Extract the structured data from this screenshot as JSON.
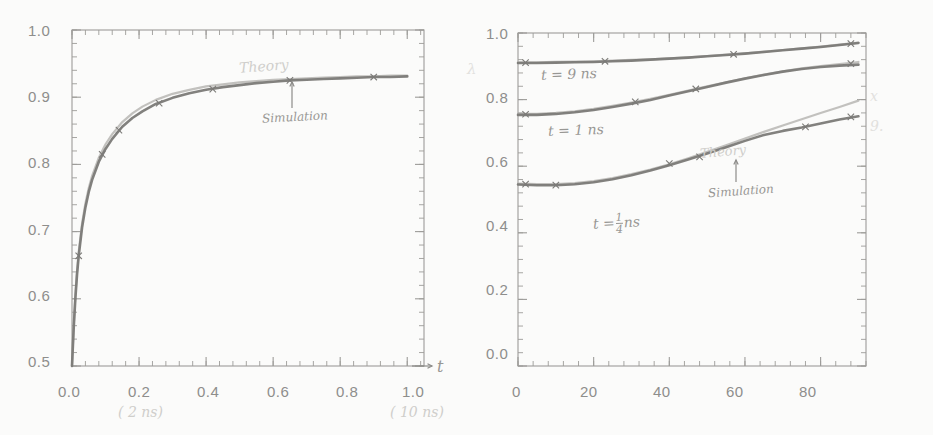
{
  "figure": {
    "background_color": "#fbfbfa",
    "ink_color": "#6f6e6c",
    "pencil_color": "#a8a7a4",
    "panel_count": 2
  },
  "chart_data": [
    {
      "type": "line",
      "panel": "left",
      "title": "",
      "xlabel": "t",
      "ylabel": "",
      "xlim": [
        0.0,
        1.05
      ],
      "ylim": [
        0.5,
        1.0
      ],
      "grid": false,
      "legend_position": "inline-annotations",
      "xticks": [
        0.0,
        0.2,
        0.4,
        0.6,
        0.8,
        1.0
      ],
      "xticklabels": [
        "0.0",
        "0.2",
        "0.4",
        "0.6",
        "0.8",
        "1.0"
      ],
      "yticks": [
        0.5,
        0.6,
        0.7,
        0.8,
        0.9,
        1.0
      ],
      "yticklabels": [
        "0.5",
        "0.6",
        "0.7",
        "0.8",
        "0.9",
        "1.0"
      ],
      "x_unit_notes": [
        {
          "at": 0.2,
          "text": "( 2 ns)"
        },
        {
          "at": 1.0,
          "text": "( 10 ns)"
        }
      ],
      "annotations": [
        {
          "name": "theory-label",
          "text": "Theory",
          "x": 0.63,
          "y": 0.945
        },
        {
          "name": "simulation-label",
          "text": "Simulation",
          "x": 0.7,
          "y": 0.875
        }
      ],
      "series": [
        {
          "name": "Theory",
          "style": "solid-light",
          "x": [
            0.0,
            0.005,
            0.01,
            0.015,
            0.02,
            0.03,
            0.04,
            0.05,
            0.06,
            0.08,
            0.1,
            0.12,
            0.15,
            0.18,
            0.21,
            0.25,
            0.3,
            0.35,
            0.4,
            0.45,
            0.5,
            0.55,
            0.6,
            0.65,
            0.7,
            0.75,
            0.8,
            0.85,
            0.9,
            0.95,
            1.0
          ],
          "y": [
            0.5,
            0.56,
            0.605,
            0.641,
            0.67,
            0.712,
            0.742,
            0.765,
            0.783,
            0.81,
            0.83,
            0.845,
            0.863,
            0.876,
            0.886,
            0.896,
            0.905,
            0.911,
            0.916,
            0.919,
            0.922,
            0.924,
            0.926,
            0.927,
            0.928,
            0.929,
            0.93,
            0.931,
            0.931,
            0.932,
            0.932
          ]
        },
        {
          "name": "Simulation",
          "style": "solid-dark",
          "x": [
            0.0,
            0.005,
            0.01,
            0.015,
            0.02,
            0.03,
            0.04,
            0.05,
            0.06,
            0.08,
            0.1,
            0.12,
            0.15,
            0.18,
            0.21,
            0.25,
            0.3,
            0.35,
            0.4,
            0.45,
            0.5,
            0.55,
            0.6,
            0.65,
            0.7,
            0.75,
            0.8,
            0.85,
            0.9,
            0.95,
            1.0
          ],
          "y": [
            0.5,
            0.556,
            0.6,
            0.636,
            0.664,
            0.706,
            0.736,
            0.759,
            0.777,
            0.804,
            0.823,
            0.838,
            0.856,
            0.869,
            0.879,
            0.89,
            0.899,
            0.906,
            0.911,
            0.915,
            0.918,
            0.921,
            0.923,
            0.925,
            0.926,
            0.927,
            0.928,
            0.929,
            0.93,
            0.93,
            0.931
          ]
        }
      ],
      "markers": {
        "series": "Simulation",
        "x": [
          0.02,
          0.09,
          0.14,
          0.26,
          0.42,
          0.65,
          0.9
        ],
        "y": [
          0.664,
          0.815,
          0.851,
          0.891,
          0.912,
          0.925,
          0.93
        ]
      }
    },
    {
      "type": "line",
      "panel": "right",
      "title": "",
      "xlabel": "",
      "ylabel": "",
      "xlim": [
        0,
        92
      ],
      "ylim": [
        0.0,
        1.0
      ],
      "grid": false,
      "legend_position": "inline-annotations",
      "xticks": [
        0,
        20,
        40,
        60,
        80
      ],
      "xticklabels": [
        "0",
        "20",
        "40",
        "60",
        "80"
      ],
      "yticks": [
        0.0,
        0.2,
        0.4,
        0.6,
        0.8,
        1.0
      ],
      "yticklabels": [
        "0.0",
        "0.2",
        "0.4",
        "0.6",
        "0.8",
        "1.0"
      ],
      "annotations": [
        {
          "name": "curve-label-9ns",
          "text": "t = 9 ns",
          "x": 15,
          "y": 0.862
        },
        {
          "name": "curve-label-1ns",
          "text": "t = 1 ns",
          "x": 17,
          "y": 0.695
        },
        {
          "name": "curve-label-quarter-ns",
          "text": "t = 1/4 ns",
          "x": 31,
          "y": 0.472
        },
        {
          "name": "theory-label",
          "text": "Theory",
          "x": 55,
          "y": 0.672
        },
        {
          "name": "simulation-label",
          "text": "Simulation",
          "x": 58,
          "y": 0.578
        }
      ],
      "series": [
        {
          "name": "t = 9 ns (theory)",
          "style": "solid-light",
          "x": [
            0,
            5,
            10,
            15,
            20,
            25,
            30,
            35,
            40,
            45,
            50,
            55,
            60,
            65,
            70,
            75,
            80,
            85,
            90
          ],
          "y": [
            0.912,
            0.912,
            0.913,
            0.914,
            0.915,
            0.917,
            0.919,
            0.921,
            0.924,
            0.927,
            0.931,
            0.935,
            0.939,
            0.944,
            0.949,
            0.954,
            0.959,
            0.965,
            0.971
          ]
        },
        {
          "name": "t = 9 ns (simulation)",
          "style": "solid-dark",
          "x": [
            0,
            5,
            10,
            15,
            20,
            25,
            30,
            35,
            40,
            45,
            50,
            55,
            60,
            65,
            70,
            75,
            80,
            85,
            90
          ],
          "y": [
            0.91,
            0.91,
            0.911,
            0.912,
            0.913,
            0.915,
            0.917,
            0.92,
            0.923,
            0.926,
            0.93,
            0.934,
            0.938,
            0.943,
            0.948,
            0.953,
            0.958,
            0.964,
            0.97
          ]
        },
        {
          "name": "t = 1 ns (theory)",
          "style": "solid-light",
          "x": [
            0,
            5,
            10,
            15,
            20,
            25,
            30,
            35,
            40,
            45,
            50,
            55,
            60,
            65,
            70,
            75,
            80,
            85,
            90
          ],
          "y": [
            0.757,
            0.757,
            0.76,
            0.765,
            0.772,
            0.781,
            0.791,
            0.802,
            0.814,
            0.827,
            0.84,
            0.852,
            0.864,
            0.875,
            0.885,
            0.894,
            0.901,
            0.907,
            0.913
          ]
        },
        {
          "name": "t = 1 ns (simulation)",
          "style": "solid-dark",
          "x": [
            0,
            5,
            10,
            15,
            20,
            25,
            30,
            35,
            40,
            45,
            50,
            55,
            60,
            65,
            70,
            75,
            80,
            85,
            90
          ],
          "y": [
            0.754,
            0.754,
            0.757,
            0.762,
            0.769,
            0.778,
            0.788,
            0.799,
            0.812,
            0.825,
            0.838,
            0.851,
            0.863,
            0.874,
            0.884,
            0.892,
            0.898,
            0.902,
            0.905
          ]
        },
        {
          "name": "t = 1/4 ns (theory)",
          "style": "solid-light",
          "x": [
            0,
            5,
            10,
            15,
            20,
            25,
            30,
            35,
            40,
            45,
            50,
            55,
            60,
            65,
            70,
            75,
            80,
            85,
            90
          ],
          "y": [
            0.548,
            0.546,
            0.546,
            0.549,
            0.555,
            0.564,
            0.576,
            0.59,
            0.606,
            0.624,
            0.643,
            0.663,
            0.683,
            0.703,
            0.722,
            0.741,
            0.76,
            0.778,
            0.797
          ]
        },
        {
          "name": "t = 1/4 ns (simulation)",
          "style": "solid-dark",
          "x": [
            0,
            5,
            10,
            15,
            20,
            25,
            30,
            35,
            40,
            45,
            50,
            55,
            60,
            65,
            70,
            75,
            80,
            85,
            90
          ],
          "y": [
            0.545,
            0.543,
            0.543,
            0.546,
            0.552,
            0.561,
            0.573,
            0.587,
            0.603,
            0.62,
            0.638,
            0.657,
            0.676,
            0.694,
            0.706,
            0.716,
            0.728,
            0.74,
            0.75
          ]
        }
      ],
      "markers": {
        "x": [
          2,
          23,
          57,
          88,
          2,
          31,
          47,
          88,
          2,
          10,
          40,
          48,
          76,
          88
        ],
        "y": [
          0.911,
          0.915,
          0.936,
          0.968,
          0.756,
          0.793,
          0.832,
          0.908,
          0.546,
          0.543,
          0.608,
          0.628,
          0.718,
          0.748
        ]
      }
    }
  ],
  "side_marks": [
    {
      "name": "side-mark-upper",
      "text": "x"
    },
    {
      "name": "side-mark-lower",
      "text": "9."
    }
  ]
}
